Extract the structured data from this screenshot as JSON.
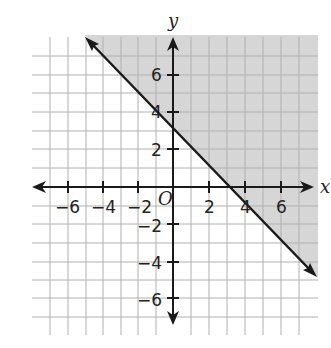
{
  "graph": {
    "x_axis_label": "x",
    "y_axis_label": "y",
    "origin_label": "O",
    "x_ticks": [
      {
        "value": -6,
        "label": "−6"
      },
      {
        "value": -4,
        "label": "−4"
      },
      {
        "value": -2,
        "label": "−2"
      },
      {
        "value": 2,
        "label": "2"
      },
      {
        "value": 4,
        "label": "4"
      },
      {
        "value": 6,
        "label": "6"
      }
    ],
    "y_ticks": [
      {
        "value": 6,
        "label": "6"
      },
      {
        "value": 4,
        "label": "4"
      },
      {
        "value": 2,
        "label": "2"
      },
      {
        "value": -2,
        "label": "−2"
      },
      {
        "value": -4,
        "label": "−4"
      },
      {
        "value": -6,
        "label": "−6"
      }
    ],
    "boundary_line": "y = -x + 3",
    "shaded_region": "y >= -x + 3",
    "colors": {
      "shade": "#d6d6d6",
      "grid": "#b0b0b0",
      "axis": "#1a1a1a"
    }
  }
}
